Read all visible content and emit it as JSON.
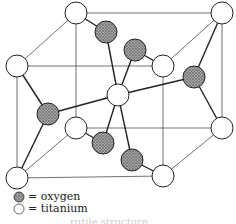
{
  "legend": [
    {
      "symbol": "oxygen-sphere",
      "label": "= oxygen",
      "color": "#888888"
    },
    {
      "symbol": "titanium-sphere",
      "label": "= titanium",
      "color": "#ffffff"
    }
  ],
  "caption": "rutile structure"
}
